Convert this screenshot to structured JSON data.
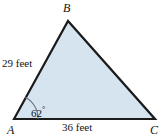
{
  "figure": {
    "type": "triangle-diagram",
    "background_color": "#ffffff",
    "fill_color": "#d6e4ef",
    "stroke_color": "#1b1b1b",
    "arc_color": "#6f6f8c",
    "vertices": {
      "a": {
        "label": "A",
        "x": 14,
        "y": 119
      },
      "b": {
        "label": "B",
        "x": 68,
        "y": 21
      },
      "c": {
        "label": "C",
        "x": 155,
        "y": 119
      }
    },
    "sides": [
      {
        "name": "ab",
        "label": "29 feet",
        "value": 29,
        "unit": "feet"
      },
      {
        "name": "ac",
        "label": "36 feet",
        "value": 36,
        "unit": "feet"
      }
    ],
    "angles": [
      {
        "at": "A",
        "value": 62,
        "unit": "degrees",
        "label": "62",
        "degree_symbol": "°"
      }
    ]
  }
}
